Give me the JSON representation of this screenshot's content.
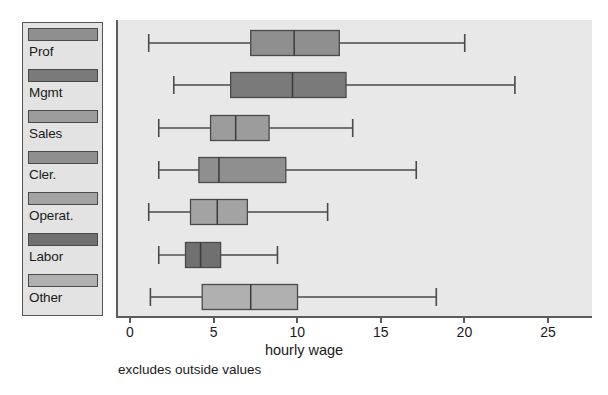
{
  "chart_data": {
    "type": "box",
    "title": "",
    "xlabel": "hourly wage",
    "ylabel": "",
    "xlim": [
      0,
      26.5
    ],
    "xticks": [
      0,
      5,
      10,
      15,
      20,
      25
    ],
    "xticklabels": [
      "0",
      "5",
      "10",
      "15",
      "20",
      "25"
    ],
    "grid": false,
    "legend_position": "left-outside",
    "annotation": "excludes outside values",
    "categories": [
      "Prof",
      "Mgmt",
      "Sales",
      "Cler.",
      "Operat.",
      "Labor",
      "Other"
    ],
    "boxes": [
      {
        "label": "Prof",
        "whisker_low": 1.0,
        "q1": 7.1,
        "median": 9.7,
        "q3": 12.4,
        "whisker_high": 19.9,
        "color": "#8f8f8f"
      },
      {
        "label": "Mgmt",
        "whisker_low": 2.5,
        "q1": 5.9,
        "median": 9.6,
        "q3": 12.8,
        "whisker_high": 22.9,
        "color": "#7a7a7a"
      },
      {
        "label": "Sales",
        "whisker_low": 1.6,
        "q1": 4.7,
        "median": 6.2,
        "q3": 8.2,
        "whisker_high": 13.2,
        "color": "#9c9c9c"
      },
      {
        "label": "Cler.",
        "whisker_low": 1.6,
        "q1": 4.0,
        "median": 5.2,
        "q3": 9.2,
        "whisker_high": 17.0,
        "color": "#8f8f8f"
      },
      {
        "label": "Operat.",
        "whisker_low": 1.0,
        "q1": 3.5,
        "median": 5.1,
        "q3": 6.9,
        "whisker_high": 11.7,
        "color": "#a3a3a3"
      },
      {
        "label": "Labor",
        "whisker_low": 1.6,
        "q1": 3.2,
        "median": 4.1,
        "q3": 5.3,
        "whisker_high": 8.7,
        "color": "#707070"
      },
      {
        "label": "Other",
        "whisker_low": 1.1,
        "q1": 4.2,
        "median": 7.1,
        "q3": 9.9,
        "whisker_high": 18.2,
        "color": "#b0b0b0"
      }
    ]
  },
  "legend": {
    "items": [
      {
        "label": "Prof",
        "color": "#8f8f8f"
      },
      {
        "label": "Mgmt",
        "color": "#7a7a7a"
      },
      {
        "label": "Sales",
        "color": "#9c9c9c"
      },
      {
        "label": "Cler.",
        "color": "#8f8f8f"
      },
      {
        "label": "Operat.",
        "color": "#a3a3a3"
      },
      {
        "label": "Labor",
        "color": "#707070"
      },
      {
        "label": "Other",
        "color": "#b0b0b0"
      }
    ]
  },
  "axis": {
    "xlabel": "hourly wage",
    "ticks": [
      "0",
      "5",
      "10",
      "15",
      "20",
      "25"
    ]
  },
  "footnote": "excludes outside values",
  "colors": {
    "plot_background": "#e8e8e8",
    "legend_background": "#e3e3e3",
    "frame": "#5c5c5c",
    "outline": "#4a4a4a",
    "text": "#1a1a1a"
  }
}
